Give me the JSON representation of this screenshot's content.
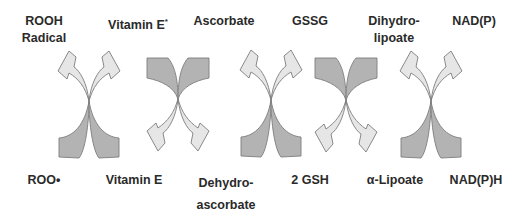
{
  "diagram": {
    "title": "",
    "top_labels": [
      {
        "line1": "ROOH",
        "line2": "Radical"
      },
      {
        "line1": "Vitamin E",
        "superscript": "*"
      },
      {
        "line1": "Ascorbate"
      },
      {
        "line1": "GSSG"
      },
      {
        "line1": "Dihydro-",
        "line2": "lipoate"
      },
      {
        "line1": "NAD(P)"
      }
    ],
    "bottom_labels": [
      {
        "line1": "ROO•"
      },
      {
        "line1": "Vitamin E"
      },
      {
        "line1": "Dehydro-",
        "line2": "ascorbate"
      },
      {
        "line1": "2 GSH"
      },
      {
        "line1": "α-Lipoate"
      },
      {
        "line1": "NAD(P)H"
      }
    ],
    "crossings": [
      {
        "between": [
          "ROOH Radical / ROO•",
          "Vitamin E* / Vitamin E"
        ],
        "direction": "up"
      },
      {
        "between": [
          "Vitamin E* / Vitamin E",
          "Ascorbate / Dehydroascorbate"
        ],
        "direction": "down"
      },
      {
        "between": [
          "Ascorbate / Dehydroascorbate",
          "GSSG / 2 GSH"
        ],
        "direction": "up"
      },
      {
        "between": [
          "GSSG / 2 GSH",
          "Dihydrolipoate / α-Lipoate"
        ],
        "direction": "down"
      },
      {
        "between": [
          "Dihydrolipoate / α-Lipoate",
          "NAD(P) / NAD(P)H"
        ],
        "direction": "up"
      }
    ],
    "colors": {
      "arrow_light": "#e6e6e6",
      "arrow_dark": "#b3b3b3",
      "arrow_outline": "#7d7d7d",
      "text": "#2a2a2a"
    }
  }
}
